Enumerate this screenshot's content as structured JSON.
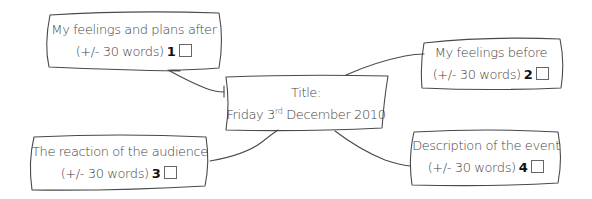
{
  "diagram": {
    "type": "mind-map",
    "center": {
      "label": "Title:",
      "date_prefix": "Friday 3",
      "date_suffix": "rd",
      "date_rest": " December 2010"
    },
    "nodes": [
      {
        "id": 1,
        "title": "My feelings and plans after",
        "words": "(+/- 30 words)",
        "number": "1",
        "checked": false
      },
      {
        "id": 2,
        "title": "My feelings before",
        "words": "(+/- 30 words)",
        "number": "2",
        "checked": false
      },
      {
        "id": 3,
        "title": "The reaction of the audience",
        "words": "(+/- 30 words)",
        "number": "3",
        "checked": false
      },
      {
        "id": 4,
        "title": "Description of the event",
        "words": "(+/- 30 words)",
        "number": "4",
        "checked": false
      }
    ],
    "colors": {
      "stroke": "#4a4a4a",
      "text": "#444444",
      "background": "#ffffff"
    }
  }
}
